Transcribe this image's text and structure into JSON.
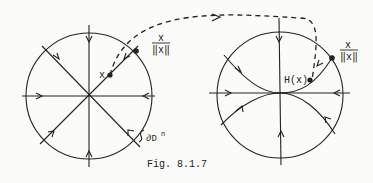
{
  "figure": {
    "caption": "Fig. 8.1.7",
    "left_panel": {
      "point_label": "x",
      "boundary_point_numerator": "x",
      "boundary_point_denominator": "‖x‖",
      "boundary_label": "∂D",
      "boundary_label_sup": "n"
    },
    "right_panel": {
      "point_label": "H(x)",
      "boundary_point_numerator": "x",
      "boundary_point_denominator": "‖x‖"
    }
  },
  "colors": {
    "ink": "#222222",
    "paper": "#fbfbf9"
  }
}
